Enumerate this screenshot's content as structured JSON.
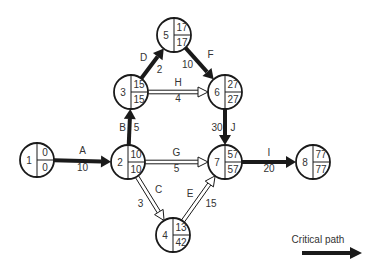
{
  "diagram": {
    "type": "activity-on-arrow network (CPM)",
    "nodes": [
      {
        "id": "1",
        "x": 37,
        "y": 160,
        "es": "0",
        "ls": "0"
      },
      {
        "id": "2",
        "x": 128,
        "y": 162,
        "es": "10",
        "ls": "10"
      },
      {
        "id": "3",
        "x": 131,
        "y": 92,
        "es": "15",
        "ls": "15"
      },
      {
        "id": "4",
        "x": 173,
        "y": 235,
        "es": "13",
        "ls": "42"
      },
      {
        "id": "5",
        "x": 174,
        "y": 35,
        "es": "17",
        "ls": "17"
      },
      {
        "id": "6",
        "x": 225,
        "y": 92,
        "es": "27",
        "ls": "27"
      },
      {
        "id": "7",
        "x": 225,
        "y": 162,
        "es": "57",
        "ls": "57"
      },
      {
        "id": "8",
        "x": 313,
        "y": 162,
        "es": "77",
        "ls": "77"
      }
    ],
    "edges": [
      {
        "activity": "A",
        "from": "1",
        "to": "2",
        "duration": "10",
        "critical": true
      },
      {
        "activity": "B",
        "from": "2",
        "to": "3",
        "duration": "5",
        "critical": true
      },
      {
        "activity": "C",
        "from": "2",
        "to": "4",
        "duration": "3",
        "critical": false
      },
      {
        "activity": "D",
        "from": "3",
        "to": "5",
        "duration": "2",
        "critical": true
      },
      {
        "activity": "E",
        "from": "4",
        "to": "7",
        "duration": "15",
        "critical": false
      },
      {
        "activity": "F",
        "from": "5",
        "to": "6",
        "duration": "10",
        "critical": true
      },
      {
        "activity": "G",
        "from": "2",
        "to": "7",
        "duration": "5",
        "critical": false
      },
      {
        "activity": "H",
        "from": "3",
        "to": "6",
        "duration": "4",
        "critical": false
      },
      {
        "activity": "I",
        "from": "7",
        "to": "8",
        "duration": "20",
        "critical": true
      },
      {
        "activity": "J",
        "from": "6",
        "to": "7",
        "duration": "30",
        "critical": true
      }
    ]
  },
  "legend": {
    "critical_path_label": "Critical path"
  },
  "colors": {
    "line": "#1a1a1a",
    "text": "#333333",
    "background": "#ffffff"
  }
}
